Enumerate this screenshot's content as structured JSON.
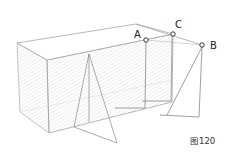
{
  "diagram": {
    "points": [
      {
        "label": "A",
        "x": 146,
        "y": 40,
        "label_x": 134,
        "label_y": 30
      },
      {
        "label": "C",
        "x": 173,
        "y": 34,
        "label_x": 175,
        "label_y": 20
      },
      {
        "label": "B",
        "x": 202,
        "y": 45,
        "label_x": 210,
        "label_y": 41
      }
    ],
    "caption": "图120",
    "colors": {
      "line": "#9a9a9a",
      "hatch": "#d8d8d8",
      "dark": "#555555"
    }
  }
}
